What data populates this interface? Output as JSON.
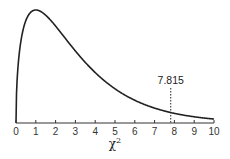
{
  "chart_data": {
    "type": "line",
    "title": "",
    "xlabel": "χ²",
    "ylabel": "",
    "distribution": "chi-square",
    "degrees_of_freedom": 3,
    "xlim": [
      0,
      10
    ],
    "x_ticks": [
      0,
      1,
      2,
      3,
      4,
      5,
      6,
      7,
      8,
      9,
      10
    ],
    "grid": false,
    "legend": null,
    "series": [
      {
        "name": "chi-square pdf (df=3)",
        "x": [
          0,
          0.25,
          0.5,
          1,
          1.5,
          2,
          3,
          4,
          5,
          6,
          7,
          7.815,
          8,
          9,
          10
        ],
        "values": [
          0,
          0.176,
          0.22,
          0.242,
          0.231,
          0.208,
          0.154,
          0.108,
          0.073,
          0.048,
          0.032,
          0.022,
          0.021,
          0.013,
          0.008
        ]
      }
    ],
    "annotations": [
      {
        "type": "vertical-dotted-line",
        "x": 7.815,
        "label": "7.815"
      }
    ],
    "x_label_main": "χ",
    "x_label_sup": "2"
  }
}
